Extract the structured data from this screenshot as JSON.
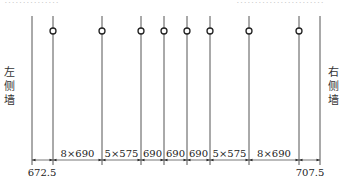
{
  "title_fragment_left": "……………",
  "title_fragment_right": "……………………",
  "walls": {
    "left": {
      "label": "左侧墙",
      "chars": [
        "左",
        "侧",
        "墙"
      ],
      "x": 32
    },
    "right": {
      "label": "右侧墙",
      "chars": [
        "右",
        "侧",
        "墙"
      ],
      "x": 320
    }
  },
  "lines": [
    {
      "x": 53,
      "circle": true
    },
    {
      "x": 102,
      "circle": true
    },
    {
      "x": 141,
      "circle": true
    },
    {
      "x": 164,
      "circle": true
    },
    {
      "x": 187,
      "circle": true
    },
    {
      "x": 210,
      "circle": true
    },
    {
      "x": 249,
      "circle": true
    },
    {
      "x": 299,
      "circle": true
    }
  ],
  "dimensions": {
    "segments": [
      {
        "from": 32,
        "to": 53,
        "label": ""
      },
      {
        "from": 53,
        "to": 102,
        "label": "8×690"
      },
      {
        "from": 102,
        "to": 141,
        "label": "5×575"
      },
      {
        "from": 141,
        "to": 164,
        "label": "690"
      },
      {
        "from": 164,
        "to": 187,
        "label": "690"
      },
      {
        "from": 187,
        "to": 210,
        "label": "690"
      },
      {
        "from": 210,
        "to": 249,
        "label": "5×575"
      },
      {
        "from": 249,
        "to": 299,
        "label": "8×690"
      },
      {
        "from": 299,
        "to": 320,
        "label": ""
      }
    ],
    "end_left": "672.5",
    "end_right": "707.5"
  },
  "colors": {
    "line": "#555555",
    "text": "#222222"
  }
}
